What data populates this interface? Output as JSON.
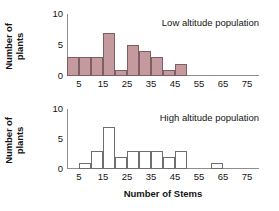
{
  "chart_data": [
    {
      "type": "bar",
      "title": "Low altitude population",
      "xlabel": "Number of Stems",
      "ylabel": "Number of plants",
      "xlim": [
        0,
        80
      ],
      "ylim": [
        0,
        10
      ],
      "xticks": [
        "5",
        "15",
        "25",
        "35",
        "45",
        "55",
        "65",
        "75"
      ],
      "xtick_values": [
        5,
        15,
        25,
        35,
        45,
        55,
        65,
        75
      ],
      "yticks": [
        "0",
        "5",
        "10"
      ],
      "ytick_values": [
        0,
        5,
        10
      ],
      "grid": false,
      "bin_width": 5,
      "bin_starts": [
        0,
        5,
        10,
        15,
        20,
        25,
        30,
        35,
        40,
        45
      ],
      "values": [
        3,
        3,
        3,
        7,
        1,
        5,
        4,
        3,
        1,
        2
      ],
      "bar_style": "filled",
      "bar_color": "#c59a9f",
      "bar_edge_color": "#7d5f63"
    },
    {
      "type": "bar",
      "title": "High altitude population",
      "xlabel": "Number of Stems",
      "ylabel": "Number of plants",
      "xlim": [
        0,
        80
      ],
      "ylim": [
        0,
        10
      ],
      "xticks": [
        "5",
        "15",
        "25",
        "35",
        "45",
        "55",
        "65",
        "75"
      ],
      "xtick_values": [
        5,
        15,
        25,
        35,
        45,
        55,
        65,
        75
      ],
      "yticks": [
        "0",
        "5",
        "10"
      ],
      "ytick_values": [
        0,
        5,
        10
      ],
      "grid": false,
      "bin_width": 5,
      "bin_starts": [
        0,
        5,
        10,
        15,
        20,
        25,
        30,
        35,
        40,
        45,
        50,
        55,
        60
      ],
      "values": [
        0,
        1,
        3,
        7,
        2,
        3,
        3,
        3,
        2,
        3,
        0,
        0,
        1
      ],
      "bar_style": "hollow",
      "bar_color": "#ffffff",
      "bar_edge_color": "#6e6e6e"
    }
  ],
  "figure": {
    "axis_color": "#8d8d8d",
    "xaxis_title": "Number of Stems",
    "panels": [
      {
        "yaxis_title_line1": "Number of",
        "yaxis_title_line2": "plants",
        "caption": "Low altitude population"
      },
      {
        "yaxis_title_line1": "Number of",
        "yaxis_title_line2": "plants",
        "caption": "High altitude population"
      }
    ]
  }
}
